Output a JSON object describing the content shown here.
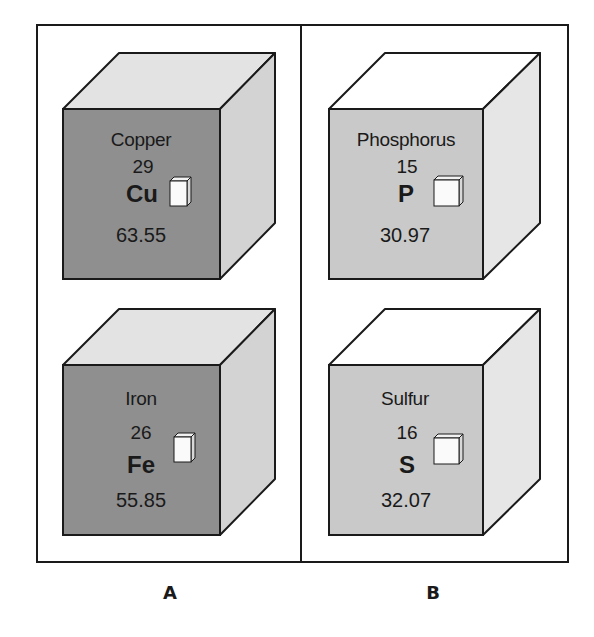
{
  "figure": {
    "groups": [
      {
        "label": "A",
        "colors": {
          "front": "#8f8f8f",
          "side": "#d3d3d3",
          "top": "#e3e3e3"
        },
        "elements": [
          {
            "name": "Copper",
            "atomic_number": "29",
            "symbol": "Cu",
            "atomic_mass": "63.55"
          },
          {
            "name": "Iron",
            "atomic_number": "26",
            "symbol": "Fe",
            "atomic_mass": "55.85"
          }
        ]
      },
      {
        "label": "B",
        "colors": {
          "front": "#c9c9c9",
          "side": "#e6e6e6",
          "top": "#ffffff"
        },
        "elements": [
          {
            "name": "Phosphorus",
            "atomic_number": "15",
            "symbol": "P",
            "atomic_mass": "30.97"
          },
          {
            "name": "Sulfur",
            "atomic_number": "16",
            "symbol": "S",
            "atomic_mass": "32.07"
          }
        ]
      }
    ]
  }
}
